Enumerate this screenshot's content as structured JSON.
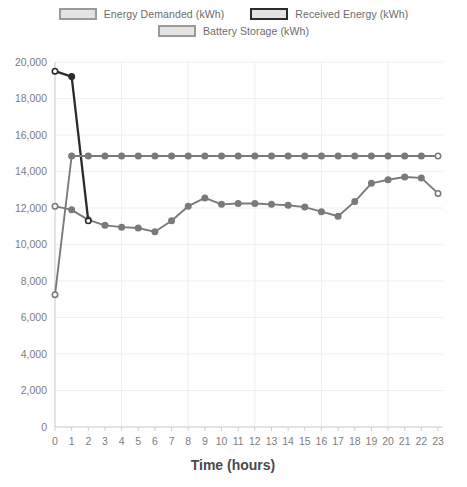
{
  "legend": {
    "rows": [
      [
        {
          "label": "Energy Demanded (kWh)",
          "swatch": "light-swatch-icon"
        },
        {
          "label": "Received Energy (kWh)",
          "swatch": "dark-swatch-icon"
        }
      ],
      [
        {
          "label": "Battery Storage (kWh)",
          "swatch": "light-swatch-icon"
        }
      ]
    ]
  },
  "axes": {
    "x_title": "Time (hours)",
    "y_title": "",
    "y_ticks": [
      "20,000",
      "18,000",
      "16,000",
      "14,000",
      "12,000",
      "10,000",
      "8,000",
      "6,000",
      "4,000",
      "2,000",
      "0"
    ],
    "x_ticks": [
      "0",
      "1",
      "2",
      "3",
      "4",
      "5",
      "6",
      "7",
      "8",
      "9",
      "10",
      "11",
      "12",
      "13",
      "14",
      "15",
      "16",
      "17",
      "18",
      "19",
      "20",
      "21",
      "22",
      "23"
    ]
  },
  "colors": {
    "line_gray": "#7a7a7a",
    "line_dark": "#2b2b2b",
    "grid": "#eeeeee",
    "axis": "#cfcfcf",
    "tick_text": "#7d7d7d",
    "title_text": "#4a4a4a"
  },
  "chart_data": {
    "type": "line",
    "title": "",
    "xlabel": "Time (hours)",
    "ylabel": "",
    "xlim": [
      0,
      23
    ],
    "ylim": [
      0,
      20000
    ],
    "ytick_step": 2000,
    "grid": true,
    "legend_position": "top",
    "x": [
      0,
      1,
      2,
      3,
      4,
      5,
      6,
      7,
      8,
      9,
      10,
      11,
      12,
      13,
      14,
      15,
      16,
      17,
      18,
      19,
      20,
      21,
      22,
      23
    ],
    "series": [
      {
        "name": "Energy Demanded (kWh)",
        "color": "#7a7a7a",
        "values": [
          12100,
          11900,
          11350,
          11050,
          10950,
          10900,
          10700,
          11300,
          12100,
          12550,
          12200,
          12250,
          12250,
          12200,
          12150,
          12050,
          11800,
          11550,
          12350,
          13350,
          13550,
          13700,
          13650,
          12800
        ]
      },
      {
        "name": "Received Energy (kWh)",
        "color": "#2b2b2b",
        "values": [
          19500,
          19200,
          11300,
          null,
          null,
          null,
          null,
          null,
          null,
          null,
          null,
          null,
          null,
          null,
          null,
          null,
          null,
          null,
          null,
          null,
          null,
          null,
          null,
          null
        ]
      },
      {
        "name": "Battery Storage (kWh)",
        "color": "#7a7a7a",
        "values": [
          7250,
          14850,
          14850,
          14850,
          14850,
          14850,
          14850,
          14850,
          14850,
          14850,
          14850,
          14850,
          14850,
          14850,
          14850,
          14850,
          14850,
          14850,
          14850,
          14850,
          14850,
          14850,
          14850,
          14850
        ]
      }
    ]
  }
}
